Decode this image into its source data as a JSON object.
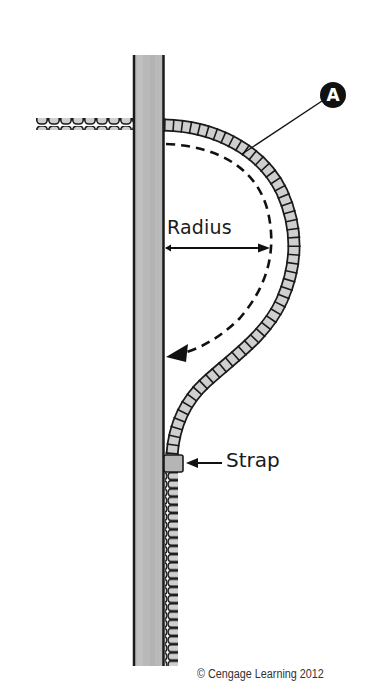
{
  "diagram": {
    "labels": {
      "callout": "A",
      "radius": "Radius",
      "strap": "Strap"
    },
    "copyright": "© Cengage Learning 2012",
    "colors": {
      "post_fill": "#b8b8b8",
      "post_edge": "#1a1a1a",
      "conduit_fill": "#cfcfcf",
      "conduit_edge": "#1a1a1a",
      "strap_fill": "#b5b5b5",
      "line": "#111111"
    },
    "components": [
      {
        "name": "wooden-post",
        "description": "vertical wood post"
      },
      {
        "name": "horizontal-conduit",
        "description": "flexible conduit entering post from left"
      },
      {
        "name": "bent-conduit",
        "description": "conduit looping outward with a bend radius then down the post"
      },
      {
        "name": "strap",
        "description": "strap securing conduit to post"
      },
      {
        "name": "radius-arrow",
        "description": "horizontal arrow indicating bend radius"
      },
      {
        "name": "dashed-bend-arrow",
        "description": "dashed curved arrow showing bend direction"
      },
      {
        "name": "callout-A",
        "description": "callout A pointing to the conduit bend"
      }
    ]
  }
}
